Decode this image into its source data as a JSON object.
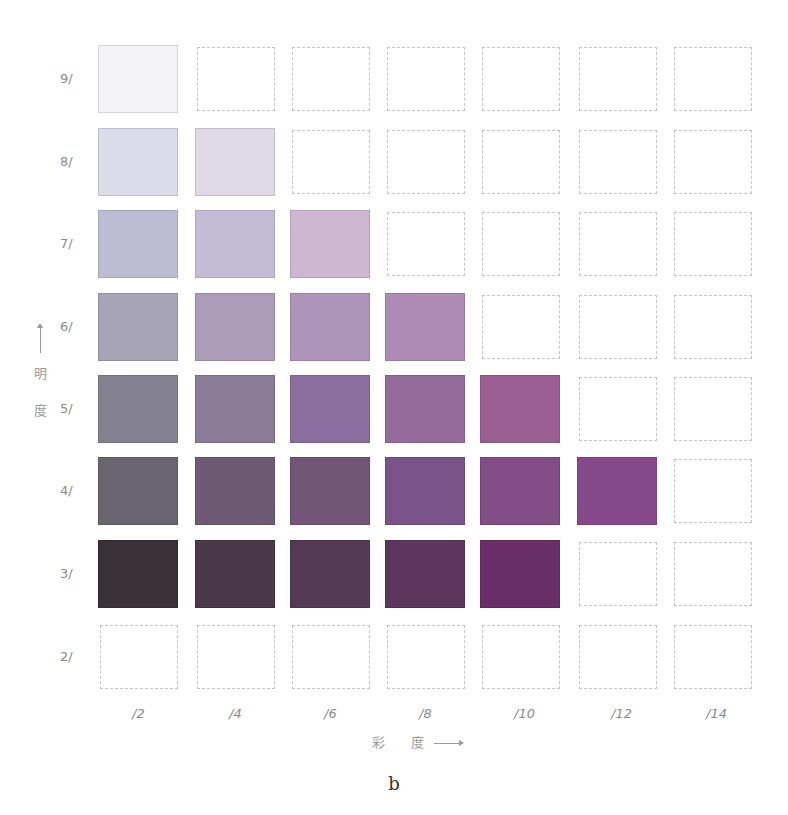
{
  "figure": {
    "label": "b",
    "y_axis_label": [
      "明",
      "度"
    ],
    "x_axis_label": [
      "彩",
      "度"
    ]
  },
  "chart_data": {
    "type": "heatmap",
    "xlabel": "彩度 (Chroma)",
    "ylabel": "明度 (Value)",
    "x_ticks": [
      "/2",
      "/4",
      "/6",
      "/8",
      "/10",
      "/12",
      "/14"
    ],
    "y_ticks": [
      "9/",
      "8/",
      "7/",
      "6/",
      "5/",
      "4/",
      "3/",
      "2/"
    ],
    "legend_position": "none",
    "grid": false,
    "cells": [
      {
        "value": "9/",
        "swatches": [
          "#f3f2f6",
          null,
          null,
          null,
          null,
          null,
          null
        ]
      },
      {
        "value": "8/",
        "swatches": [
          "#dcdbea",
          "#e0d9e8",
          null,
          null,
          null,
          null,
          null
        ]
      },
      {
        "value": "7/",
        "swatches": [
          "#bebcd2",
          "#c4bcd6",
          "#ccb6d0",
          null,
          null,
          null,
          null
        ]
      },
      {
        "value": "6/",
        "swatches": [
          "#a6a3b6",
          "#ab9cba",
          "#ad94b8",
          "#ae8bb4",
          null,
          null,
          null
        ]
      },
      {
        "value": "5/",
        "swatches": [
          "#83818f",
          "#8a7c98",
          "#8c6e9e",
          "#946b9a",
          "#9b5f94",
          null,
          null
        ]
      },
      {
        "value": "4/",
        "swatches": [
          "#686470",
          "#6e5b73",
          "#725577",
          "#7a5488",
          "#834d88",
          "#864a8a",
          null
        ]
      },
      {
        "value": "3/",
        "swatches": [
          "#3a3139",
          "#4b3848",
          "#553a55",
          "#5d365e",
          "#6a2f68",
          null,
          null
        ]
      },
      {
        "value": "2/",
        "swatches": [
          null,
          null,
          null,
          null,
          null,
          null,
          null
        ]
      }
    ]
  }
}
